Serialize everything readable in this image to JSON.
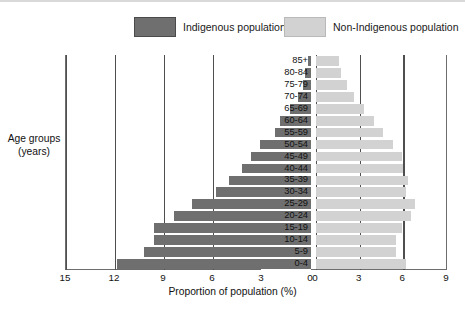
{
  "legend": {
    "indigenous": {
      "label": "Indigenous population",
      "color": "#6f6f6f"
    },
    "non_indigenous": {
      "label": "Non-Indigenous population",
      "color": "#d2d2d2"
    }
  },
  "axes": {
    "y_title_line1": "Age groups",
    "y_title_line2": "(years)",
    "x_title": "Proportion of population (%)",
    "left_ticks": [
      "15",
      "12",
      "9",
      "6",
      "3",
      "0"
    ],
    "right_ticks": [
      "0",
      "3",
      "6",
      "9"
    ]
  },
  "chart_data": {
    "type": "bar",
    "subtype": "population-pyramid",
    "title": "",
    "xlabel": "Proportion of population (%)",
    "ylabel": "Age groups (years)",
    "grid": true,
    "legend_position": "top",
    "left_axis_range": [
      15,
      0
    ],
    "right_axis_range": [
      0,
      9
    ],
    "left_axis_ticks": [
      15,
      12,
      9,
      6,
      3,
      0
    ],
    "right_axis_ticks": [
      0,
      3,
      6,
      9
    ],
    "categories": [
      "85+",
      "80-84",
      "75-79",
      "70-74",
      "65-69",
      "60-64",
      "55-59",
      "50-54",
      "45-49",
      "40-44",
      "35-39",
      "30-34",
      "25-29",
      "20-24",
      "15-19",
      "10-14",
      "5-9",
      "0-4"
    ],
    "series": [
      {
        "name": "Indigenous population",
        "color": "#6f6f6f",
        "side": "left",
        "values": [
          0.2,
          0.35,
          0.5,
          0.8,
          1.3,
          1.9,
          2.2,
          3.1,
          3.7,
          4.2,
          5.0,
          5.8,
          7.3,
          8.4,
          9.6,
          9.6,
          10.2,
          11.9
        ]
      },
      {
        "name": "Non-Indigenous population",
        "color": "#d2d2d2",
        "side": "right",
        "values": [
          1.6,
          1.7,
          2.1,
          2.6,
          3.3,
          4.0,
          4.6,
          5.3,
          5.9,
          6.0,
          6.3,
          6.2,
          6.8,
          6.5,
          5.9,
          5.5,
          5.5,
          6.2
        ]
      }
    ]
  }
}
